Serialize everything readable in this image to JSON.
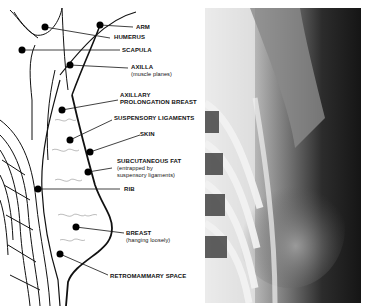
{
  "figure": {
    "left_panel": "schematic-drawing",
    "right_panel": "radiograph",
    "labels": [
      {
        "id": "arm",
        "text": "ARM",
        "sub": ""
      },
      {
        "id": "humerus",
        "text": "HUMERUS",
        "sub": ""
      },
      {
        "id": "scapula",
        "text": "SCAPULA",
        "sub": ""
      },
      {
        "id": "axilla",
        "text": "AXILLA",
        "sub": "(muscle planes)"
      },
      {
        "id": "axillary-prolongation",
        "text": "AXILLARY",
        "text2": "PROLONGATION BREAST",
        "sub": ""
      },
      {
        "id": "suspensory",
        "text": "SUSPENSORY LIGAMENTS",
        "sub": ""
      },
      {
        "id": "skin",
        "text": "SKIN",
        "sub": ""
      },
      {
        "id": "subcutaneous-fat",
        "text": "SUBCUTANEOUS FAT",
        "sub": "(entrapped by",
        "sub2": "suspensory ligaments)"
      },
      {
        "id": "rib",
        "text": "RIB",
        "sub": ""
      },
      {
        "id": "breast",
        "text": "BREAST",
        "sub": "(hanging loosely)"
      },
      {
        "id": "retromammary",
        "text": "RETROMAMMARY SPACE",
        "sub": ""
      }
    ]
  }
}
